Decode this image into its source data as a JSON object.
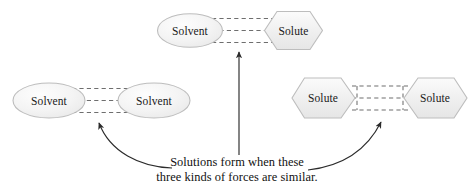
{
  "diagram": {
    "title_present": false,
    "caption": {
      "line1": "Solutions form when these",
      "line2": "three kinds of forces are similar."
    },
    "colors": {
      "shape_fill": "#f2f2f2",
      "shape_fill_highlight": "#fbfbfb",
      "shape_stroke": "#b9b9b9",
      "dash_stroke": "#6e6e6e",
      "arrow_stroke": "#2b2b2b",
      "text": "#111111",
      "background": "#ffffff"
    },
    "groups": [
      {
        "id": "solvent-solute",
        "position": "top-center",
        "description": "Solvent attracted to Solute",
        "left_particle": {
          "label": "Solvent",
          "shape": "ellipse"
        },
        "right_particle": {
          "label": "Solute",
          "shape": "hexagon"
        },
        "bond_lines": 3,
        "bond_style": "dashed"
      },
      {
        "id": "solvent-solvent",
        "position": "left",
        "description": "Solvent attracted to Solvent",
        "left_particle": {
          "label": "Solvent",
          "shape": "ellipse"
        },
        "right_particle": {
          "label": "Solvent",
          "shape": "ellipse"
        },
        "bond_lines": 3,
        "bond_style": "dashed"
      },
      {
        "id": "solute-solute",
        "position": "right",
        "description": "Solute attracted to Solute",
        "left_particle": {
          "label": "Solute",
          "shape": "hexagon"
        },
        "right_particle": {
          "label": "Solute",
          "shape": "hexagon"
        },
        "bond_lines": 3,
        "bond_style": "dashed"
      }
    ],
    "pointers": [
      {
        "id": "pointer-center",
        "style": "straight-arrow",
        "from": "caption",
        "to": "solvent-solute"
      },
      {
        "id": "pointer-left",
        "style": "curved-arrow",
        "from": "caption",
        "to": "solvent-solvent"
      },
      {
        "id": "pointer-right",
        "style": "curved-arrow",
        "from": "caption",
        "to": "solute-solute"
      }
    ]
  }
}
